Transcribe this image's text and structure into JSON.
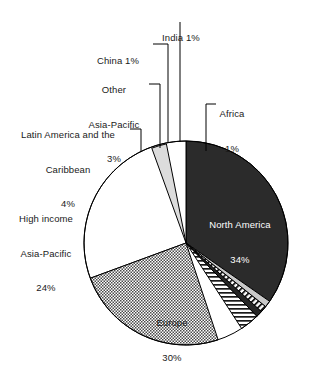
{
  "chart_data": {
    "type": "pie",
    "title": "",
    "subtitle": "",
    "xlabel": "",
    "ylabel": "",
    "legend_position": "none",
    "grid": false,
    "units": "percent",
    "total": 98,
    "start_angle_deg": 0,
    "direction": "clockwise",
    "categories": [
      "North America",
      "Africa",
      "India",
      "China",
      "Other Asia-Pacific",
      "Latin America and the Caribbean",
      "High income Asia-Pacific",
      "Europe"
    ],
    "values": [
      34,
      1,
      1,
      1,
      3,
      4,
      24,
      30
    ],
    "slices": [
      {
        "name": "North America",
        "value": 34,
        "label_name": "North America",
        "label_pct": "34%",
        "fill": "#2b2b2b",
        "pattern": "solid-dark",
        "text_color": "#ffffff",
        "label_placement": "inside"
      },
      {
        "name": "Africa",
        "value": 1,
        "label_name": "Africa",
        "label_pct": "1%",
        "fill": "#c9c9c9",
        "pattern": "solid-light-gray",
        "text_color": "#1a1a1a",
        "label_placement": "outside-leader"
      },
      {
        "name": "India",
        "value": 1,
        "label_name": "India 1%",
        "label_pct": "1%",
        "fill": "#ffffff",
        "pattern": "diagonal-stripes",
        "text_color": "#1a1a1a",
        "label_placement": "outside-leader"
      },
      {
        "name": "China",
        "value": 1,
        "label_name": "China 1%",
        "label_pct": "1%",
        "fill": "#262626",
        "pattern": "solid-dark",
        "text_color": "#1a1a1a",
        "label_placement": "outside-leader"
      },
      {
        "name": "Other Asia-Pacific",
        "value": 3,
        "label_name": "Other\nAsia-Pacific",
        "label_pct": "3%",
        "fill": "#ffffff",
        "pattern": "horizontal-stripes",
        "text_color": "#1a1a1a",
        "label_placement": "outside-leader"
      },
      {
        "name": "Latin America and the Caribbean",
        "value": 4,
        "label_name": "Latin America and the\nCaribbean",
        "label_pct": "4%",
        "fill": "#dcdcdc",
        "pattern": "solid-light-gray",
        "text_color": "#1a1a1a",
        "label_placement": "outside-leader"
      },
      {
        "name": "High income Asia-Pacific",
        "value": 24,
        "label_name": "High income\nAsia-Pacific",
        "label_pct": "24%",
        "fill": "#ffffff",
        "pattern": "checkerboard",
        "text_color": "#1a1a1a",
        "label_placement": "outside"
      },
      {
        "name": "Europe",
        "value": 30,
        "label_name": "Europe",
        "label_pct": "30%",
        "fill": "#ffffff",
        "pattern": "solid-white",
        "text_color": "#1a1a1a",
        "label_placement": "inside"
      }
    ]
  },
  "labels": {
    "india": {
      "name": "India 1%"
    },
    "china": {
      "name": "China 1%"
    },
    "other_asia_pacific": {
      "line1": "Other",
      "line2": "Asia-Pacific",
      "pct": "3%"
    },
    "africa": {
      "name": "Africa",
      "pct": "1%"
    },
    "latin_america": {
      "line1": "Latin America and the",
      "line2": "Caribbean",
      "pct": "4%"
    },
    "high_income_asia_pacific": {
      "line1": "High income",
      "line2": "Asia-Pacific",
      "pct": "24%"
    },
    "north_america": {
      "name": "North America",
      "pct": "34%"
    },
    "europe": {
      "name": "Europe",
      "pct": "30%"
    }
  }
}
